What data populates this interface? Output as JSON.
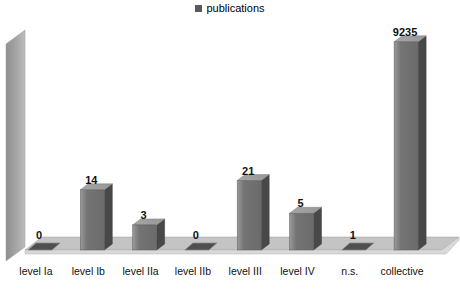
{
  "legend": {
    "label": "publications",
    "marker_color": "#5a5a5a",
    "position": "top"
  },
  "chart_data": {
    "type": "bar",
    "projection": "3d",
    "title": "",
    "categories": [
      "level Ia",
      "level Ib",
      "level IIa",
      "level IIb",
      "level III",
      "level IV",
      "n.s.",
      "collective"
    ],
    "series": [
      {
        "name": "publications",
        "values": [
          0,
          14,
          3,
          0,
          21,
          5,
          1,
          9235
        ]
      }
    ],
    "data_labels": [
      "0",
      "14",
      "3",
      "0",
      "21",
      "5",
      "1",
      "9235"
    ],
    "xlabel": "",
    "ylabel": "",
    "value_axis": {
      "scale": "log10",
      "visible": false,
      "min": 1
    },
    "grid": false,
    "legend_position": "top",
    "colors": {
      "background": "#ffffff",
      "bar_front": "#747474",
      "bar_front_highlight": "#9a9a9a",
      "bar_side": "#484848",
      "bar_top": "#989898",
      "bar_flat": "#4f4f4f",
      "wall_dark": "#8f8f8f",
      "wall_light": "#bcbcbc",
      "floor": "#c4c4c4",
      "floor_edge": "#d9d9d9",
      "outline": "#9e9e9e",
      "text": "#111111"
    }
  }
}
